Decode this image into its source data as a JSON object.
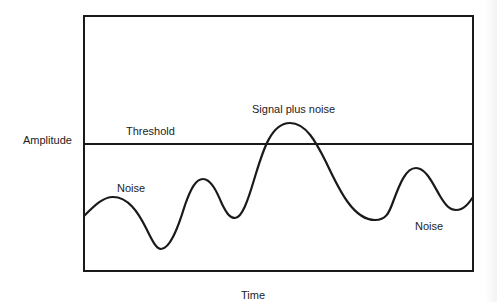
{
  "diagram": {
    "y_axis_label": "Amplitude",
    "x_axis_label": "Time",
    "threshold_label": "Threshold",
    "annotations": {
      "noise_left": "Noise",
      "signal_plus_noise": "Signal plus noise",
      "noise_right": "Noise"
    },
    "colors": {
      "line": "#1a1a1a",
      "background": "#ffffff"
    },
    "frame": {
      "left": 84,
      "top": 16,
      "right": 473,
      "bottom": 271
    },
    "threshold_y": 144,
    "waveform_points": [
      [
        84,
        216
      ],
      [
        112,
        197
      ],
      [
        160,
        249
      ],
      [
        203,
        179
      ],
      [
        235,
        218
      ],
      [
        290,
        123
      ],
      [
        375,
        220
      ],
      [
        416,
        168
      ],
      [
        455,
        210
      ],
      [
        473,
        197
      ]
    ]
  }
}
